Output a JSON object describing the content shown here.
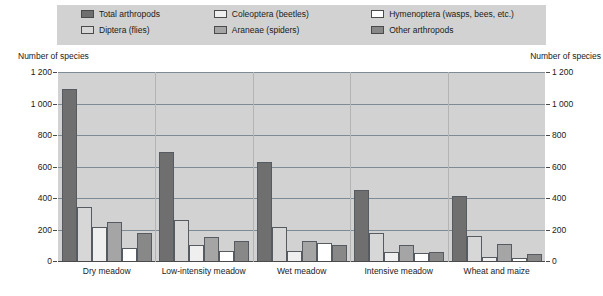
{
  "legend": {
    "items": [
      {
        "label": "Total arthropods",
        "color": "#6f6f6f",
        "icon": "legend-swatch-icon"
      },
      {
        "label": "Coleoptera (beetles)",
        "color": "#efefef",
        "icon": "legend-swatch-icon"
      },
      {
        "label": "Hymenoptera (wasps, bees, etc.)",
        "color": "#ffffff",
        "icon": "legend-swatch-icon"
      },
      {
        "label": "Diptera (flies)",
        "color": "#d7d7d7",
        "icon": "legend-swatch-icon"
      },
      {
        "label": "Araneae (spiders)",
        "color": "#a5a5a5",
        "icon": "legend-swatch-icon"
      },
      {
        "label": "Other arthropods",
        "color": "#888888",
        "icon": "legend-swatch-icon"
      }
    ]
  },
  "axis": {
    "left_caption": "Number of species",
    "right_caption": "Number of species",
    "ticks": [
      "1 200",
      "1 000",
      "800",
      "600",
      "400",
      "200",
      "0"
    ]
  },
  "chart_data": {
    "type": "bar",
    "title": "",
    "subtitle": "",
    "xlabel": "",
    "ylabel": "Number of species",
    "ylim": [
      0,
      1200
    ],
    "ytick_values": [
      0,
      200,
      400,
      600,
      800,
      1000,
      1200
    ],
    "ytick_labels": [
      "0",
      "200",
      "400",
      "600",
      "800",
      "1 000",
      "1 200"
    ],
    "grid": true,
    "legend_position": "top",
    "dual_axis": true,
    "categories": [
      "Dry meadow",
      "Low-intensity meadow",
      "Wet meadow",
      "Intensive meadow",
      "Wheat and maize"
    ],
    "series": [
      {
        "name": "Total arthropods",
        "color": "#6f6f6f",
        "values": [
          1090,
          690,
          630,
          450,
          410
        ]
      },
      {
        "name": "Diptera (flies)",
        "color": "#d7d7d7",
        "values": [
          345,
          260,
          215,
          180,
          160
        ]
      },
      {
        "name": "Coleoptera (beetles)",
        "color": "#efefef",
        "values": [
          215,
          100,
          65,
          60,
          25
        ]
      },
      {
        "name": "Araneae (spiders)",
        "color": "#a5a5a5",
        "values": [
          250,
          155,
          125,
          100,
          105
        ]
      },
      {
        "name": "Hymenoptera (wasps, bees, etc.)",
        "color": "#ffffff",
        "values": [
          85,
          65,
          115,
          50,
          20
        ]
      },
      {
        "name": "Other arthropods",
        "color": "#888888",
        "values": [
          175,
          125,
          100,
          55,
          45
        ]
      }
    ]
  }
}
